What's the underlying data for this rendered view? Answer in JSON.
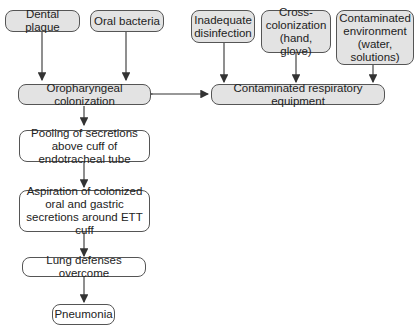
{
  "diagram": {
    "nodes": {
      "dental_plaque": "Dental plaque",
      "oral_bacteria": "Oral bacteria",
      "inadequate_disinfection": "Inadequate disinfection",
      "cross_colonization": "Cross-colonization (hand, glove)",
      "contaminated_environment": "Contaminated environment (water, solutions)",
      "oropharyngeal_colonization": "Oropharyngeal colonization",
      "contaminated_equipment": "Contaminated respiratory equipment",
      "pooling": "Pooling of secretions above cuff of endotracheal tube",
      "aspiration": "Aspiration of colonized oral and gastric secretions around ETT cuff",
      "lung_defenses": "Lung defenses overcome",
      "pneumonia": "Pneumonia"
    },
    "edges": [
      {
        "from": "dental_plaque",
        "to": "oropharyngeal_colonization"
      },
      {
        "from": "oral_bacteria",
        "to": "oropharyngeal_colonization"
      },
      {
        "from": "inadequate_disinfection",
        "to": "contaminated_equipment"
      },
      {
        "from": "cross_colonization",
        "to": "contaminated_equipment"
      },
      {
        "from": "contaminated_environment",
        "to": "contaminated_equipment"
      },
      {
        "from": "oropharyngeal_colonization",
        "to": "contaminated_equipment",
        "bidirectional": true
      },
      {
        "from": "oropharyngeal_colonization",
        "to": "pooling"
      },
      {
        "from": "pooling",
        "to": "aspiration"
      },
      {
        "from": "aspiration",
        "to": "lung_defenses"
      },
      {
        "from": "lung_defenses",
        "to": "pneumonia"
      }
    ],
    "colors": {
      "shaded_fill": "#e3e3e3",
      "border": "#555555",
      "arrow": "#333333"
    }
  }
}
